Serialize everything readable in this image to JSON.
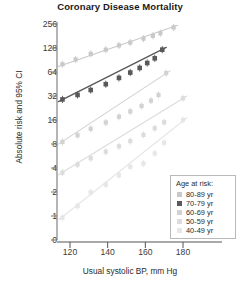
{
  "chart_data": {
    "type": "scatter",
    "title": "Coronary Disease Mortality",
    "xlabel": "Usual systolic BP, mm Hg",
    "ylabel": "Absolute risk and 95% CI",
    "yscale": "log2",
    "ylim": [
      0.7,
      300
    ],
    "xlim": [
      112,
      190
    ],
    "yticks": [
      0,
      1,
      2,
      4,
      8,
      16,
      32,
      64,
      128,
      256
    ],
    "ytick_labels": [
      "0",
      "1",
      "2",
      "4",
      "8",
      "16",
      "32",
      "64",
      "128",
      "256"
    ],
    "xticks": [
      120,
      140,
      160,
      180
    ],
    "xtick_labels": [
      "120",
      "140",
      "160",
      "180"
    ],
    "grid": false,
    "legend_position": "lower-right",
    "legend_title": "Age at risk:",
    "series": [
      {
        "name": "80-89 yr",
        "color": "#c9c9c9",
        "x": [
          116,
          123,
          131,
          139,
          146,
          152,
          159,
          164,
          168,
          175
        ],
        "y": [
          80,
          92,
          108,
          122,
          138,
          150,
          168,
          182,
          196,
          232
        ]
      },
      {
        "name": "70-79 yr",
        "color": "#595959",
        "x": [
          116,
          124,
          131,
          139,
          146,
          152,
          157,
          161,
          165,
          169
        ],
        "y": [
          29,
          33,
          38,
          45,
          54,
          63,
          72,
          83,
          95,
          122
        ]
      },
      {
        "name": "60-69 yr",
        "color": "#d2d2d2",
        "x": [
          116,
          124,
          131,
          139,
          146,
          152,
          158,
          163,
          167,
          171
        ],
        "y": [
          8.5,
          10.3,
          12.4,
          14.9,
          17.6,
          20.5,
          24.0,
          28.0,
          33.0,
          62.0
        ]
      },
      {
        "name": "50-59 yr",
        "color": "#dcdcdc",
        "x": [
          116,
          124,
          131,
          139,
          146,
          152,
          159,
          165,
          170,
          180
        ],
        "y": [
          3.5,
          4.4,
          5.3,
          6.4,
          7.5,
          8.7,
          10.4,
          12.6,
          15.0,
          30.0
        ]
      },
      {
        "name": "40-49 yr",
        "color": "#e6e6e6",
        "x": [
          116,
          124,
          131,
          139,
          146,
          152,
          159,
          165,
          170,
          180
        ],
        "y": [
          0.95,
          1.33,
          1.98,
          2.48,
          3.25,
          4.15,
          4.55,
          6.1,
          8.3,
          16.0
        ]
      }
    ],
    "legend_entries": [
      {
        "label": "80-89 yr",
        "color": "#c9c9c9"
      },
      {
        "label": "70-79 yr",
        "color": "#595959"
      },
      {
        "label": "60-69 yr",
        "color": "#d2d2d2"
      },
      {
        "label": "50-59 yr",
        "color": "#dcdcdc"
      },
      {
        "label": "40-49 yr",
        "color": "#e6e6e6"
      }
    ]
  }
}
